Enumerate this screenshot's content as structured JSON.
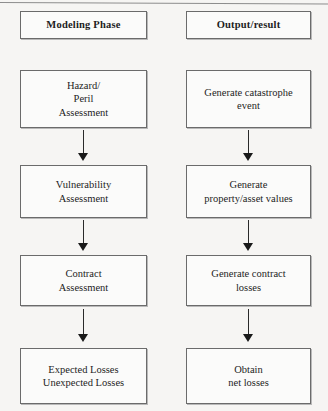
{
  "diagram": {
    "background_color": "#f6f5f3",
    "box_border_color": "#6b6b6b",
    "arrow_color": "#1a1a1a",
    "columns": [
      {
        "id": "modeling-phase",
        "header": "Modeling Phase",
        "steps": [
          {
            "id": "hazard-peril-assessment",
            "label": "Hazard/\nPeril\nAssessment"
          },
          {
            "id": "vulnerability-assessment",
            "label": "Vulnerability\nAssessment"
          },
          {
            "id": "contract-assessment",
            "label": "Contract\nAssessment"
          },
          {
            "id": "expected-unexpected-losses",
            "label": "Expected Losses\nUnexpected Losses"
          }
        ]
      },
      {
        "id": "output-result",
        "header": "Output/result",
        "steps": [
          {
            "id": "generate-catastrophe-event",
            "label": "Generate catastrophe\nevent"
          },
          {
            "id": "generate-property-asset-values",
            "label": "Generate\nproperty/asset values"
          },
          {
            "id": "generate-contract-losses",
            "label": "Generate contract\nlosses"
          },
          {
            "id": "obtain-net-losses",
            "label": "Obtain\nnet losses"
          }
        ]
      }
    ]
  }
}
